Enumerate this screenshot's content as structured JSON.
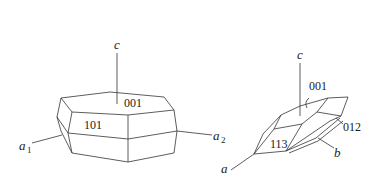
{
  "diagram": {
    "left_crystal": {
      "name": "hexagonal prism crystal",
      "axes": {
        "c": {
          "label": "c"
        },
        "a1": {
          "label": "a",
          "subscript": "1"
        },
        "a2": {
          "label": "a",
          "subscript": "2"
        }
      },
      "faces": [
        {
          "label": "001"
        },
        {
          "label": "101"
        }
      ]
    },
    "right_crystal": {
      "name": "lens-shaped crystal",
      "axes": {
        "c": {
          "label": "c"
        },
        "a": {
          "label": "a"
        },
        "b": {
          "label": "b"
        }
      },
      "faces": [
        {
          "label": "001"
        },
        {
          "label": "113"
        },
        {
          "label": "012"
        }
      ]
    },
    "colors": {
      "line": "#333333",
      "background": "#ffffff"
    }
  }
}
